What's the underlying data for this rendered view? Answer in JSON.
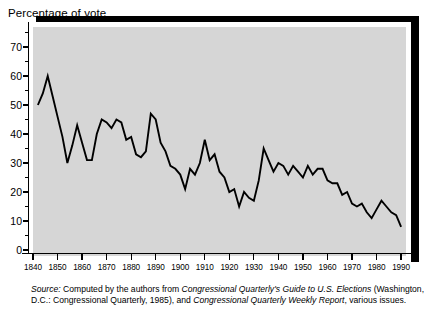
{
  "chart_data": {
    "type": "line",
    "title": "Percentage of vote",
    "xlabel": "",
    "ylabel": "Percentage of vote",
    "ylim": [
      0,
      75
    ],
    "xlim": [
      1840,
      1992
    ],
    "grid": false,
    "legend": "none",
    "yticks": [
      0,
      10,
      20,
      30,
      40,
      50,
      60,
      70
    ],
    "ytick_labels": [
      "0",
      "10",
      "20",
      "30",
      "40",
      "50",
      "60",
      "70"
    ],
    "yticks_minor": [
      5,
      15,
      25,
      35,
      45,
      55,
      65,
      75
    ],
    "xticks": [
      1840,
      1850,
      1860,
      1870,
      1880,
      1890,
      1900,
      1910,
      1920,
      1930,
      1940,
      1950,
      1960,
      1970,
      1980,
      1990
    ],
    "xtick_labels": [
      "1840",
      "1850",
      "1860",
      "1870",
      "1880",
      "1890",
      "1900",
      "1910",
      "1920",
      "1930",
      "1940",
      "1950",
      "1960",
      "1970",
      "1980",
      "1990"
    ],
    "series": [
      {
        "name": "Percentage of vote",
        "x": [
          1842,
          1844,
          1846,
          1848,
          1850,
          1852,
          1854,
          1856,
          1858,
          1860,
          1862,
          1864,
          1866,
          1868,
          1870,
          1872,
          1874,
          1876,
          1878,
          1880,
          1882,
          1884,
          1886,
          1888,
          1890,
          1892,
          1894,
          1896,
          1898,
          1900,
          1902,
          1904,
          1906,
          1908,
          1910,
          1912,
          1914,
          1916,
          1918,
          1920,
          1922,
          1924,
          1926,
          1928,
          1930,
          1932,
          1934,
          1936,
          1938,
          1940,
          1942,
          1944,
          1946,
          1948,
          1950,
          1952,
          1954,
          1956,
          1958,
          1960,
          1962,
          1964,
          1966,
          1968,
          1970,
          1972,
          1974,
          1976,
          1978,
          1980,
          1982,
          1984,
          1986,
          1988,
          1990
        ],
        "values": [
          50,
          54,
          60,
          53,
          46,
          39,
          30,
          36,
          43,
          37,
          31,
          31,
          40,
          45,
          44,
          42,
          45,
          44,
          38,
          39,
          33,
          32,
          34,
          47,
          45,
          37,
          34,
          29,
          28,
          26,
          21,
          28,
          26,
          30,
          38,
          31,
          33,
          27,
          25,
          20,
          21,
          15,
          20,
          18,
          17,
          24,
          35,
          31,
          27,
          30,
          29,
          26,
          29,
          27,
          25,
          29,
          26,
          28,
          28,
          24,
          23,
          23,
          19,
          20,
          16,
          15,
          16,
          13,
          11,
          14,
          17,
          15,
          13,
          12,
          8
        ]
      }
    ],
    "annotations": [],
    "colors": {
      "plot_background": "#d6d6d6",
      "line": "#000000",
      "frame": "#000000",
      "page_background": "#ffffff"
    }
  },
  "source_note": {
    "prefix": "Source:",
    "text_1": " Computed by the authors from ",
    "italic_1": "Congressional Quarterly's Guide to U.S. Elections",
    "text_2": " (Washington, D.C.: Congressional Quarterly, 1985), and ",
    "italic_2": "Congressional Quarterly Weekly Report",
    "text_3": ", various issues."
  }
}
